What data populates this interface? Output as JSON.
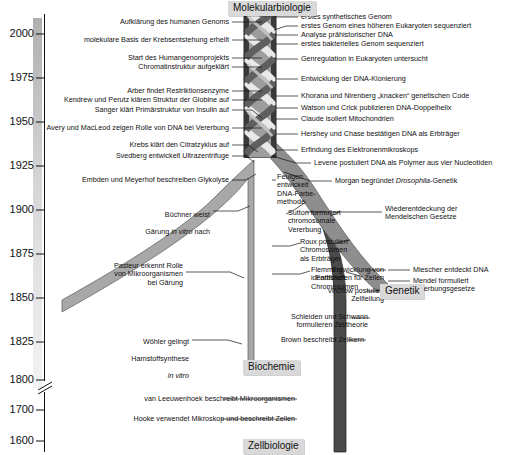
{
  "figure": {
    "title_implicit": "Geschichte der Molekularbiologie",
    "axis": {
      "name": "year-axis",
      "ticks": [
        {
          "label": "2000",
          "y": 34
        },
        {
          "label": "1975",
          "y": 78
        },
        {
          "label": "1950",
          "y": 122
        },
        {
          "label": "1925",
          "y": 166
        },
        {
          "label": "1900",
          "y": 210
        },
        {
          "label": "1875",
          "y": 254
        },
        {
          "label": "1850",
          "y": 298
        },
        {
          "label": "1825",
          "y": 342
        },
        {
          "label": "1800",
          "y": 380
        },
        {
          "label": "1700",
          "y": 410
        },
        {
          "label": "1600",
          "y": 441
        }
      ],
      "break_after": "1800"
    },
    "disciplines": [
      {
        "id": "molekularbiologie",
        "label": "Molekularbiologie",
        "x": 228,
        "y": 1
      },
      {
        "id": "genetik",
        "label": "Genetik",
        "x": 380,
        "y": 284
      },
      {
        "id": "biochemie",
        "label": "Biochemie",
        "x": 247,
        "y": 362
      },
      {
        "id": "zellbiologie",
        "label": "Zellbiologie",
        "x": 246,
        "y": 440
      }
    ],
    "colors": {
      "strand_biochemie": "#9a9a9a",
      "strand_zellbiologie": "#4a4a4a",
      "strand_genetik": "#8c8c8c",
      "box_fill": "#d9d9d9",
      "axis_bar_top": "#b4b4b4",
      "axis_bar_bottom": "#ececec",
      "line": "#111111"
    },
    "events_left": [
      {
        "text": "Aufklärung des humanen Genoms",
        "x": 60,
        "y": 19,
        "w": 169
      },
      {
        "text": "molekulare Basis der Krebsentstehung erhellt",
        "x": 34,
        "y": 37,
        "w": 195
      },
      {
        "text": "Start des Humangenomprojekts",
        "x": 60,
        "y": 55,
        "w": 169
      },
      {
        "text": "Chromatinstruktur aufgeklärt",
        "x": 60,
        "y": 64,
        "w": 169
      },
      {
        "text": "Arber findet Restriktionsenzyme",
        "x": 60,
        "y": 88,
        "w": 169
      },
      {
        "text": "Kendrew und Perutz klären Struktur der Globine auf",
        "x": 26,
        "y": 97,
        "w": 203
      },
      {
        "text": "Sanger klärt Primärstruktur von Insulin auf",
        "x": 46,
        "y": 107,
        "w": 183
      },
      {
        "text": "Avery und MacLeod zeigen Rolle von DNA bei Vererbung",
        "x": 18,
        "y": 125,
        "w": 211
      },
      {
        "text": "Krebs klärt den Citratzyklus auf",
        "x": 58,
        "y": 142,
        "w": 171
      },
      {
        "text": "Svedberg entwickelt Ultrazentrifuge",
        "x": 48,
        "y": 153,
        "w": 181
      },
      {
        "text": "Embden und Meyerhof beschreiben Glykolyse",
        "x": 29,
        "y": 177,
        "w": 200
      },
      {
        "text": "Büchner weist\nGärung in vitro nach",
        "x": 100,
        "y": 209,
        "w": 110,
        "italic_tail": "in vitro"
      },
      {
        "text": "Pasteur erkennt Rolle\nvon Mikroorganismen\nbei Gärung",
        "x": 72,
        "y": 268,
        "w": 111
      },
      {
        "text": "Wöhler gelingt\nHarnstoffsynthese\nin vitro",
        "x": 88,
        "y": 336,
        "w": 101
      }
    ],
    "events_right": [
      {
        "text": "erstes synthetisches Genom",
        "x": 300,
        "y": 14
      },
      {
        "text": "erstes Genom eines höheren Eukaryoten sequenziert",
        "x": 300,
        "y": 23
      },
      {
        "text": "Analyse prähistorischer DNA",
        "x": 300,
        "y": 32
      },
      {
        "text": "erstes bakterielles Genom sequenziert",
        "x": 300,
        "y": 41
      },
      {
        "text": "Genregulation in Eukaryoten untersucht",
        "x": 300,
        "y": 56
      },
      {
        "text": "Entwicklung der DNA-Klonierung",
        "x": 300,
        "y": 76
      },
      {
        "text": "Khorana und Nirenberg „knacken“ genetischen Code",
        "x": 300,
        "y": 93
      },
      {
        "text": "Watson und Crick publizieren DNA-Doppelhelix",
        "x": 300,
        "y": 105
      },
      {
        "text": "Claude isoliert Mitochondrien",
        "x": 300,
        "y": 116
      },
      {
        "text": "Hershey und Chase bestätigen DNA als Erbträger",
        "x": 300,
        "y": 131
      },
      {
        "text": "Erfindung des Elektronenmikroskops",
        "x": 300,
        "y": 147
      },
      {
        "text": "Levene postuliert DNA als Polymer aus vier Nucleotiden",
        "x": 313,
        "y": 160
      },
      {
        "text": "Morgan begründet Drosophila-Genetik",
        "x": 334,
        "y": 178,
        "italic": "Drosophila"
      },
      {
        "text": "Wiederentdeckung der\nMendelschen Gesetze",
        "x": 384,
        "y": 208
      },
      {
        "text": "Miescher entdeckt DNA",
        "x": 412,
        "y": 267
      },
      {
        "text": "Mendel formuliert\nVererbungsgesetze",
        "x": 412,
        "y": 278
      },
      {
        "text": "Entwicklung von\nFarbstoffen für Zellen",
        "x": 388,
        "y": 267,
        "col": "mid"
      },
      {
        "text": "Virchow postuliert\nZellteilung",
        "x": 409,
        "y": 288,
        "col": "mid"
      },
      {
        "text": "Schleiden und Schwann\nformulieren Zelltheorie",
        "x": 372,
        "y": 315,
        "col": "mid"
      },
      {
        "text": "Brown beschreibt Zellkern",
        "x": 368,
        "y": 337,
        "col": "mid"
      },
      {
        "text": "van Leeuwenhoek beschreibt Mikroorganismen",
        "x": 113,
        "y": 396
      },
      {
        "text": "Hooke verwendet Mikroskop und beschreibt Zellen",
        "x": 106,
        "y": 416
      }
    ],
    "events_inner": [
      {
        "text": "Feulgen\nentwickelt\nDNA-Farbe-\nmethode",
        "x": 277,
        "y": 176
      },
      {
        "text": "Sutton formuliert\nchromosomale\nVererbung",
        "x": 290,
        "y": 212
      },
      {
        "text": "Roux postuliert\nChromosomen\nals Erbträger",
        "x": 300,
        "y": 240
      },
      {
        "text": "Flemming\nidentifiziert\nChromosomen",
        "x": 311,
        "y": 268
      }
    ]
  }
}
